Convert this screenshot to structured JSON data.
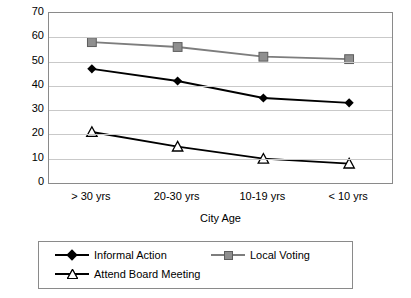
{
  "chart_data": {
    "type": "line",
    "title": "",
    "xlabel": "City Age",
    "ylabel": "",
    "categories": [
      "> 30 yrs",
      "20-30 yrs",
      "10-19 yrs",
      "< 10 yrs"
    ],
    "yticks": [
      0,
      10,
      20,
      30,
      40,
      50,
      60,
      70
    ],
    "ylim": [
      0,
      70
    ],
    "grid": true,
    "legend_position": "bottom",
    "series": [
      {
        "name": "Informal Action",
        "marker": "diamond",
        "color": "#000000",
        "values": [
          47,
          42,
          35,
          33
        ]
      },
      {
        "name": "Local Voting",
        "marker": "square",
        "color": "#8f8f8f",
        "values": [
          58,
          56,
          52,
          51
        ]
      },
      {
        "name": "Attend Board Meeting",
        "marker": "triangle-open",
        "color": "#000000",
        "values": [
          21,
          15,
          10,
          8
        ]
      }
    ]
  },
  "legend": {
    "items": [
      {
        "label": "Informal Action"
      },
      {
        "label": "Local Voting"
      },
      {
        "label": "Attend Board Meeting"
      }
    ]
  }
}
